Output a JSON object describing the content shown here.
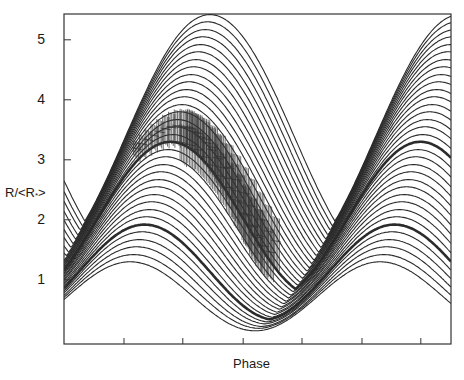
{
  "chart_data": {
    "type": "line",
    "title": "",
    "xlabel": "Phase",
    "ylabel": "R/<R*>",
    "ylabel_main": "R/<R",
    "ylabel_sub": "*",
    "ylabel_close": ">",
    "grid": false,
    "legend": null,
    "xlim": [
      0,
      1
    ],
    "ylim": [
      -0.07,
      5.43
    ],
    "yticks": [
      1,
      2,
      3,
      4,
      5
    ],
    "ytick_labels": [
      "1",
      "2",
      "3",
      "4",
      "5"
    ],
    "xticks": [
      0.155,
      0.307,
      0.463,
      0.615,
      0.77,
      0.922
    ],
    "xtick_labels": [
      "",
      "",
      "",
      "",
      "",
      ""
    ],
    "colors": {
      "line": "#2b2b2b",
      "axis": "#333333",
      "errorbar": "#333333"
    },
    "curve_family": {
      "description": "Family of periodic model curves R/<R*> vs phase; each curve = max over periods of a cos^2 arch of height H above floor L, centered at phase c, half-width w; period p",
      "period": 0.646,
      "count": 34,
      "bold_indices": [
        5,
        16
      ],
      "curves": [
        {
          "H": 1.3,
          "L": 0.15,
          "c": 0.171,
          "w": 0.323
        },
        {
          "H": 1.42,
          "L": 0.19,
          "c": 0.18,
          "w": 0.327
        },
        {
          "H": 1.55,
          "L": 0.22,
          "c": 0.188,
          "w": 0.33
        },
        {
          "H": 1.67,
          "L": 0.26,
          "c": 0.195,
          "w": 0.334
        },
        {
          "H": 1.8,
          "L": 0.29,
          "c": 0.202,
          "w": 0.337
        },
        {
          "H": 1.92,
          "L": 0.33,
          "c": 0.208,
          "w": 0.341
        },
        {
          "H": 2.05,
          "L": 0.36,
          "c": 0.214,
          "w": 0.344
        },
        {
          "H": 2.17,
          "L": 0.4,
          "c": 0.221,
          "w": 0.348
        },
        {
          "H": 2.3,
          "L": 0.43,
          "c": 0.227,
          "w": 0.351
        },
        {
          "H": 2.42,
          "L": 0.47,
          "c": 0.233,
          "w": 0.355
        },
        {
          "H": 2.55,
          "L": 0.5,
          "c": 0.239,
          "w": 0.358
        },
        {
          "H": 2.67,
          "L": 0.54,
          "c": 0.245,
          "w": 0.362
        },
        {
          "H": 2.8,
          "L": 0.57,
          "c": 0.251,
          "w": 0.365
        },
        {
          "H": 2.92,
          "L": 0.61,
          "c": 0.257,
          "w": 0.369
        },
        {
          "H": 3.05,
          "L": 0.64,
          "c": 0.263,
          "w": 0.372
        },
        {
          "H": 3.17,
          "L": 0.68,
          "c": 0.269,
          "w": 0.376
        },
        {
          "H": 3.3,
          "L": 0.71,
          "c": 0.275,
          "w": 0.379
        },
        {
          "H": 3.42,
          "L": 0.75,
          "c": 0.281,
          "w": 0.383
        },
        {
          "H": 3.55,
          "L": 0.78,
          "c": 0.287,
          "w": 0.386
        },
        {
          "H": 3.67,
          "L": 0.82,
          "c": 0.293,
          "w": 0.39
        },
        {
          "H": 3.8,
          "L": 0.85,
          "c": 0.299,
          "w": 0.393
        },
        {
          "H": 3.92,
          "L": 0.89,
          "c": 0.305,
          "w": 0.397
        },
        {
          "H": 4.05,
          "L": 0.92,
          "c": 0.311,
          "w": 0.4
        },
        {
          "H": 4.17,
          "L": 0.96,
          "c": 0.317,
          "w": 0.404
        },
        {
          "H": 4.3,
          "L": 0.99,
          "c": 0.323,
          "w": 0.407
        },
        {
          "H": 4.42,
          "L": 1.03,
          "c": 0.329,
          "w": 0.411
        },
        {
          "H": 4.55,
          "L": 1.06,
          "c": 0.335,
          "w": 0.414
        },
        {
          "H": 4.67,
          "L": 1.1,
          "c": 0.341,
          "w": 0.418
        },
        {
          "H": 4.8,
          "L": 1.13,
          "c": 0.347,
          "w": 0.421
        },
        {
          "H": 4.92,
          "L": 1.17,
          "c": 0.353,
          "w": 0.425
        },
        {
          "H": 5.05,
          "L": 1.2,
          "c": 0.359,
          "w": 0.428
        },
        {
          "H": 5.17,
          "L": 1.24,
          "c": 0.365,
          "w": 0.432
        },
        {
          "H": 5.3,
          "L": 1.27,
          "c": 0.371,
          "w": 0.435
        },
        {
          "H": 5.42,
          "L": 1.31,
          "c": 0.377,
          "w": 0.439
        }
      ]
    },
    "errorbar_series": {
      "description": "Observed points with vertical error bars overlaid (three streaks), phase, value, half-error",
      "points": [
        [
          0.18,
          3.2,
          0.12
        ],
        [
          0.195,
          3.28,
          0.14
        ],
        [
          0.21,
          3.35,
          0.16
        ],
        [
          0.225,
          3.42,
          0.18
        ],
        [
          0.24,
          3.48,
          0.2
        ],
        [
          0.255,
          3.53,
          0.22
        ],
        [
          0.27,
          3.56,
          0.24
        ],
        [
          0.285,
          3.58,
          0.26
        ],
        [
          0.3,
          3.57,
          0.28
        ],
        [
          0.315,
          3.54,
          0.3
        ],
        [
          0.33,
          3.48,
          0.32
        ],
        [
          0.345,
          3.4,
          0.34
        ],
        [
          0.36,
          3.3,
          0.36
        ],
        [
          0.375,
          3.18,
          0.38
        ],
        [
          0.39,
          3.04,
          0.4
        ],
        [
          0.405,
          2.88,
          0.42
        ],
        [
          0.42,
          2.7,
          0.44
        ],
        [
          0.435,
          2.5,
          0.46
        ],
        [
          0.45,
          2.3,
          0.48
        ],
        [
          0.465,
          2.1,
          0.5
        ],
        [
          0.48,
          1.9,
          0.5
        ],
        [
          0.495,
          1.72,
          0.48
        ],
        [
          0.51,
          1.58,
          0.45
        ],
        [
          0.525,
          1.48,
          0.4
        ],
        [
          0.3,
          3.3,
          0.3
        ],
        [
          0.32,
          3.26,
          0.32
        ],
        [
          0.34,
          3.18,
          0.34
        ],
        [
          0.36,
          3.06,
          0.36
        ],
        [
          0.38,
          2.92,
          0.38
        ],
        [
          0.4,
          2.74,
          0.4
        ],
        [
          0.42,
          2.55,
          0.42
        ],
        [
          0.44,
          2.34,
          0.44
        ],
        [
          0.46,
          2.12,
          0.46
        ],
        [
          0.48,
          1.92,
          0.46
        ],
        [
          0.5,
          1.75,
          0.44
        ],
        [
          0.32,
          3.55,
          0.3
        ],
        [
          0.34,
          3.46,
          0.32
        ],
        [
          0.36,
          3.36,
          0.34
        ],
        [
          0.38,
          3.22,
          0.36
        ],
        [
          0.4,
          3.06,
          0.38
        ],
        [
          0.42,
          2.88,
          0.4
        ],
        [
          0.44,
          2.68,
          0.42
        ],
        [
          0.46,
          2.46,
          0.44
        ],
        [
          0.48,
          2.24,
          0.46
        ],
        [
          0.5,
          2.02,
          0.46
        ],
        [
          0.52,
          1.82,
          0.44
        ],
        [
          0.54,
          1.66,
          0.4
        ]
      ]
    }
  }
}
